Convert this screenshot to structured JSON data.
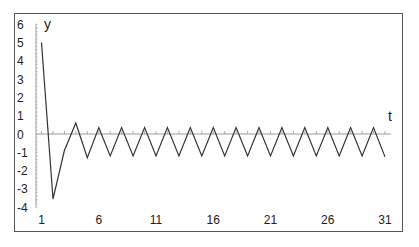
{
  "chart_data": {
    "type": "line",
    "title": "",
    "xlabel": "t",
    "ylabel": "y",
    "x": [
      1,
      2,
      3,
      4,
      5,
      6,
      7,
      8,
      9,
      10,
      11,
      12,
      13,
      14,
      15,
      16,
      17,
      18,
      19,
      20,
      21,
      22,
      23,
      24,
      25,
      26,
      27,
      28,
      29,
      30,
      31
    ],
    "series": [
      {
        "name": "y",
        "values": [
          5.0,
          -3.55,
          -0.9,
          0.6,
          -1.3,
          0.35,
          -1.2,
          0.35,
          -1.2,
          0.35,
          -1.2,
          0.35,
          -1.2,
          0.35,
          -1.2,
          0.35,
          -1.2,
          0.35,
          -1.2,
          0.35,
          -1.2,
          0.35,
          -1.2,
          0.35,
          -1.2,
          0.35,
          -1.2,
          0.35,
          -1.2,
          0.35,
          -1.25
        ]
      }
    ],
    "x_tick_labels": [
      "1",
      "6",
      "11",
      "16",
      "21",
      "26",
      "31"
    ],
    "y_tick_labels": [
      "6",
      "5",
      "4",
      "3",
      "2",
      "1",
      "0",
      "-1",
      "-2",
      "-3",
      "-4"
    ],
    "ylim": [
      -4,
      6
    ],
    "xlim": [
      1,
      31
    ],
    "grid": false,
    "legend": "none",
    "line_color": "#333333",
    "axis_color": "#999999"
  },
  "labels": {
    "y_axis": "y",
    "x_axis": "t"
  }
}
